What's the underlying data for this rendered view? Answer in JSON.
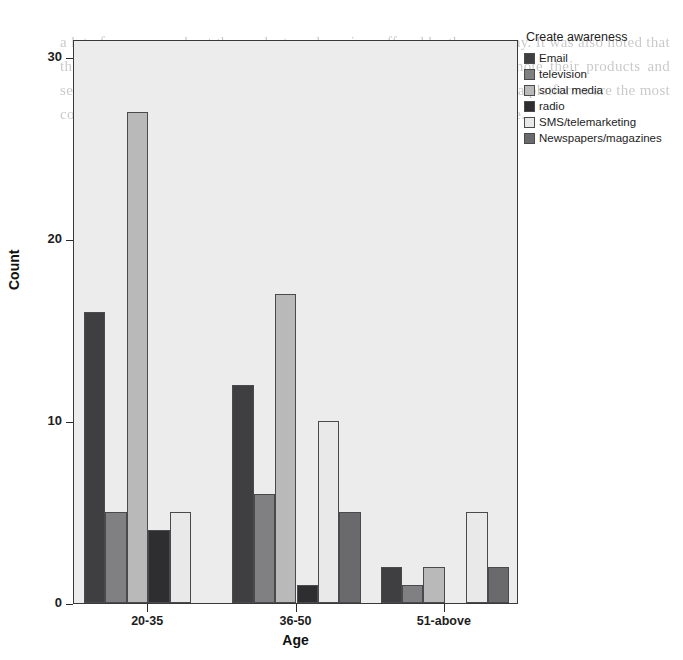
{
  "chart_data": {
    "type": "bar",
    "title": "",
    "xlabel": "Age",
    "ylabel": "Count",
    "categories": [
      "20-35",
      "36-50",
      "51-above"
    ],
    "ylim": [
      0,
      31
    ],
    "yticks": [
      0,
      10,
      20,
      30
    ],
    "grid": false,
    "legend_position": "right",
    "legend_title": "Create awareness",
    "series": [
      {
        "name": "Email",
        "color": "#3f3f42",
        "values": [
          16,
          12,
          2
        ]
      },
      {
        "name": "television",
        "color": "#808083",
        "values": [
          5,
          6,
          1
        ]
      },
      {
        "name": "social media",
        "color": "#b9b9ba",
        "values": [
          27,
          17,
          2
        ]
      },
      {
        "name": "radio",
        "color": "#2e2e31",
        "values": [
          4,
          1,
          0
        ]
      },
      {
        "name": "SMS/telemarketing",
        "color": "#e9e9ea",
        "values": [
          5,
          10,
          5
        ]
      },
      {
        "name": "Newspapers/magazines",
        "color": "#6a6a6d",
        "values": [
          0,
          5,
          2
        ]
      }
    ]
  },
  "ghost_text": "a lot of awareness about the products and services offered by the company. It was also noted that the majority of the respondents indicated that the company can promote their products and services through social media. It was further established that social media platforms are the most cost effective medium to reach a large number of people at the same time.",
  "plot": {
    "background": "#ececed",
    "border_color": "#39393b"
  }
}
